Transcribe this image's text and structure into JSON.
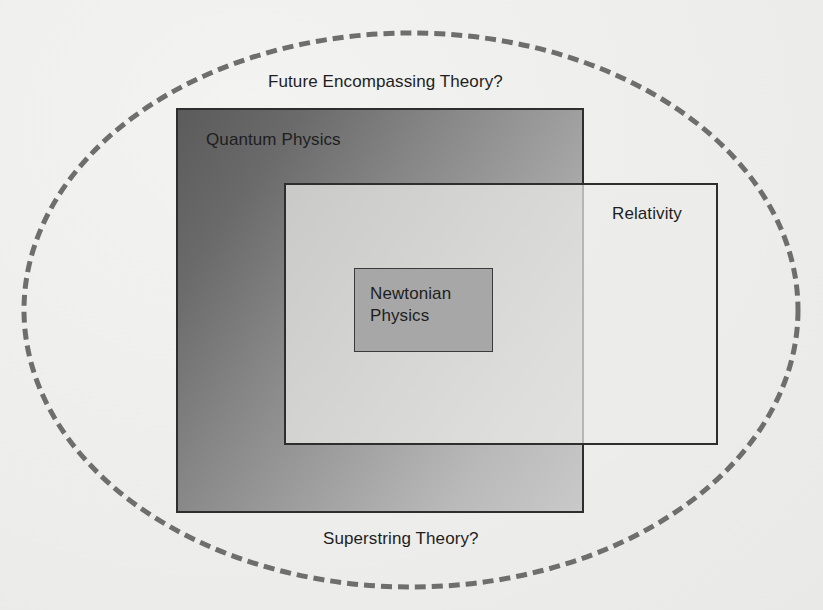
{
  "diagram": {
    "type": "nested-set-diagram",
    "outer_boundary": {
      "shape": "dashed-ellipse",
      "top_label": "Future Encompassing Theory?",
      "bottom_label": "Superstring Theory?",
      "stroke_color": "#6e6e6e"
    },
    "regions": [
      {
        "id": "quantum",
        "label": "Quantum Physics",
        "shape": "rectangle",
        "fill": "gradient dark-to-light gray"
      },
      {
        "id": "relativity",
        "label": "Relativity",
        "shape": "rectangle",
        "fill": "light translucent gray",
        "overlaps": "quantum"
      },
      {
        "id": "newtonian",
        "label_line1": "Newtonian",
        "label_line2": "Physics",
        "shape": "rectangle",
        "fill": "#a7a7a7",
        "inside": [
          "quantum",
          "relativity"
        ]
      }
    ],
    "colors": {
      "background": "#efefed",
      "border": "#2e2e2e",
      "text": "#1e1e1e",
      "dash": "#6e6e6e"
    }
  }
}
